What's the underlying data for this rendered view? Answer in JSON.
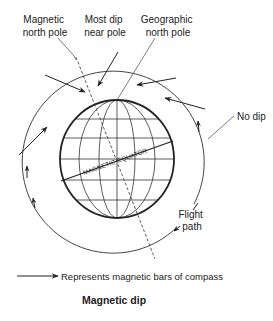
{
  "title": "Magnetic dip",
  "labels": {
    "magnetic_north_pole": [
      "Magnetic",
      "north pole"
    ],
    "most_dip": [
      "Most dip",
      "near pole"
    ],
    "geographic_north_pole": [
      "Geographic",
      "north pole"
    ],
    "no_dip": "No dip",
    "flight_path": [
      "Flight",
      "path"
    ],
    "magnetic_equator": "MAGNETIC EQUATOR"
  },
  "legend": {
    "icon": "arrow-icon",
    "text": "Represents magnetic bars of compass"
  },
  "colors": {
    "line": "#222222",
    "background": "#ffffff"
  }
}
